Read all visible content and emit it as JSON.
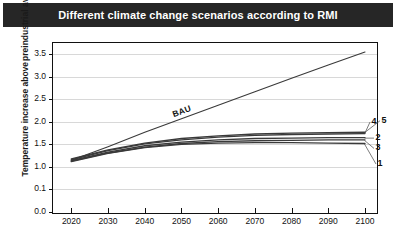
{
  "title": "Different climate change scenarios according to RMI",
  "axis": {
    "ylabel_line1": "Temperature increase above",
    "ylabel_line2": "preindustrial average (°C)"
  },
  "colors": {
    "title_band": "#262626",
    "title_text": "#ffffff",
    "grid": "#d8d8d8",
    "axis": "#111111",
    "line": "#3a3a3a",
    "background": "#ffffff"
  },
  "chart_data": {
    "type": "line",
    "title": "Different climate change scenarios according to RMI",
    "xlabel": "",
    "ylabel": "Temperature increase above preindustrial average (°C)",
    "xlim": [
      2015,
      2103
    ],
    "ylim": [
      0.0,
      3.75
    ],
    "grid": true,
    "legend_position": "inline-right",
    "xticks": [
      "2020",
      "2030",
      "2040",
      "2050",
      "2060",
      "2070",
      "2080",
      "2090",
      "2100"
    ],
    "xtick_values": [
      2020,
      2030,
      2040,
      2050,
      2060,
      2070,
      2080,
      2090,
      2100
    ],
    "yticks": [
      "0.0",
      "0.1",
      "1.0",
      "1.5",
      "2.0",
      "2.5",
      "3.0",
      "3.5"
    ],
    "ytick_values": [
      0.0,
      0.5,
      1.0,
      1.5,
      2.0,
      2.5,
      3.0,
      3.5
    ],
    "x": [
      2020,
      2030,
      2040,
      2050,
      2060,
      2070,
      2080,
      2090,
      2100
    ],
    "series": [
      {
        "name": "BAU",
        "label": "BAU",
        "label_position": "on-line",
        "values": [
          1.15,
          1.45,
          1.77,
          2.07,
          2.37,
          2.67,
          2.97,
          3.26,
          3.55
        ]
      },
      {
        "name": "5",
        "label": "5",
        "label_position": "right",
        "values": [
          1.18,
          1.38,
          1.53,
          1.63,
          1.69,
          1.73,
          1.75,
          1.76,
          1.77
        ]
      },
      {
        "name": "4",
        "label": "4",
        "label_position": "right",
        "values": [
          1.16,
          1.36,
          1.51,
          1.6,
          1.66,
          1.7,
          1.72,
          1.73,
          1.74
        ]
      },
      {
        "name": "2",
        "label": "2",
        "label_position": "right",
        "values": [
          1.14,
          1.33,
          1.47,
          1.55,
          1.6,
          1.63,
          1.64,
          1.65,
          1.65
        ]
      },
      {
        "name": "3",
        "label": "3",
        "label_position": "right",
        "values": [
          1.13,
          1.31,
          1.44,
          1.52,
          1.56,
          1.58,
          1.59,
          1.6,
          1.6
        ]
      },
      {
        "name": "1",
        "label": "1",
        "label_position": "right",
        "values": [
          1.12,
          1.3,
          1.43,
          1.5,
          1.53,
          1.54,
          1.54,
          1.53,
          1.52
        ]
      }
    ]
  }
}
